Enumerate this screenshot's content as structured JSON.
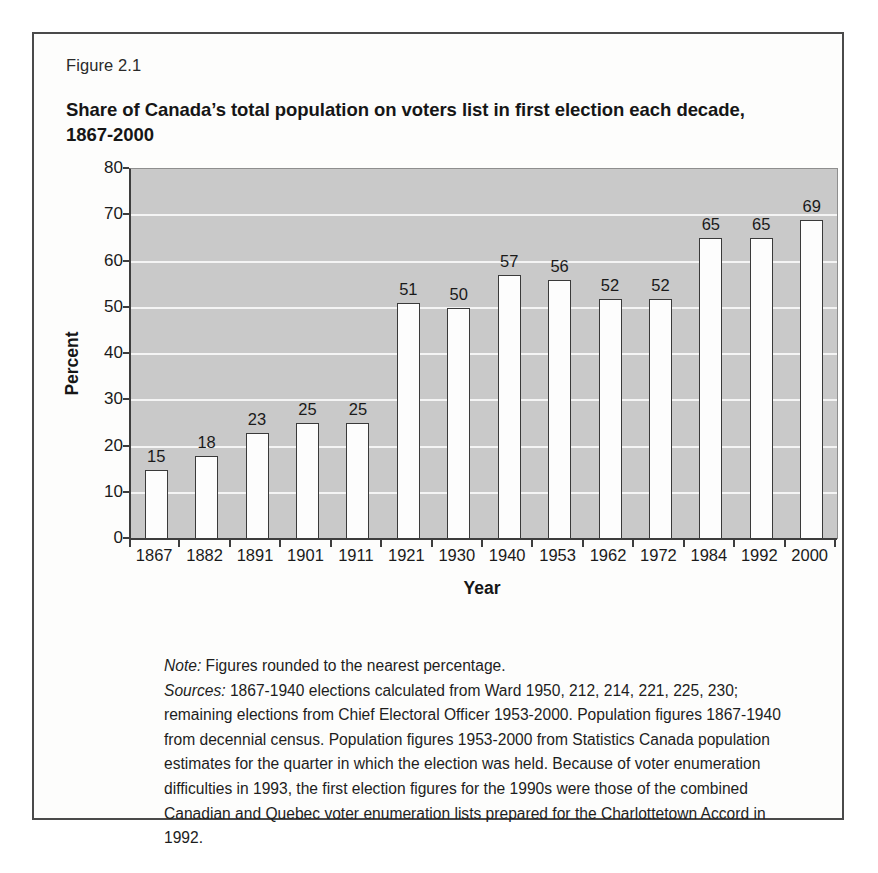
{
  "figure": {
    "number": "Figure 2.1",
    "title": "Share of Canada’s total population on voters list in first election each decade, 1867-2000"
  },
  "colors": {
    "plot_background": "#c9c9c9",
    "gridline": "#f4f4f4",
    "bar_fill": "#fdfdfd",
    "bar_border": "#3a3a3a",
    "axis": "#3d3d3d",
    "frame_border": "#4a4a4a",
    "text": "#1a1a1a"
  },
  "notes": {
    "note_lead": "Note:",
    "note_text": " Figures rounded to the nearest percentage.",
    "sources_lead": "Sources:",
    "sources_text": " 1867-1940 elections calculated from Ward 1950, 212, 214, 221, 225, 230; remaining elections from Chief Electoral Officer 1953-2000. Population figures 1867-1940 from decennial census. Population figures 1953-2000 from Statistics Canada population estimates for the quarter in which the election was held. Because of voter enumeration difficulties in 1993, the first election figures for the 1990s were those of the combined Canadian and Quebec voter enumeration lists prepared for the Charlottetown Accord in 1992."
  },
  "chart_data": {
    "type": "bar",
    "title": "Share of Canada’s total population on voters list in first election each decade, 1867-2000",
    "xlabel": "Year",
    "ylabel": "Percent",
    "ylim": [
      0,
      80
    ],
    "yticks": [
      0,
      10,
      20,
      30,
      40,
      50,
      60,
      70,
      80
    ],
    "grid": true,
    "legend": "none",
    "categories": [
      "1867",
      "1882",
      "1891",
      "1901",
      "1911",
      "1921",
      "1930",
      "1940",
      "1953",
      "1962",
      "1972",
      "1984",
      "1992",
      "2000"
    ],
    "values": [
      15,
      18,
      23,
      25,
      25,
      51,
      50,
      57,
      56,
      52,
      52,
      65,
      65,
      69
    ],
    "data_labels": [
      "15",
      "18",
      "23",
      "25",
      "25",
      "51",
      "50",
      "57",
      "56",
      "52",
      "52",
      "65",
      "65",
      "69"
    ]
  }
}
